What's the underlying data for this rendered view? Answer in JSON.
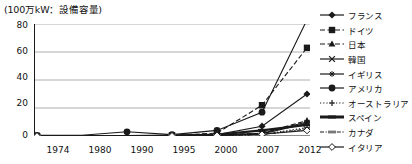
{
  "chart_data": {
    "type": "line",
    "title": "(100万kW：設備容量)",
    "xlabel": "",
    "ylabel": "100万kW：設備容量",
    "categories": [
      "1974",
      "1980",
      "1990",
      "1995",
      "2000",
      "2007",
      "2012"
    ],
    "ylim": [
      0,
      80
    ],
    "yticks": [
      0,
      20,
      40,
      60,
      80
    ],
    "grid": true,
    "legend_position": "right",
    "series": [
      {
        "name": "フランス",
        "marker": "diamond-filled",
        "line": "solid",
        "values": [
          0,
          0,
          0,
          0.5,
          1,
          7,
          30
        ]
      },
      {
        "name": "ドイツ",
        "marker": "square-filled",
        "line": "dashed",
        "values": [
          0,
          0,
          0,
          0.5,
          2,
          22,
          63
        ]
      },
      {
        "name": "日本",
        "marker": "triangle-filled",
        "line": "dashed",
        "values": [
          0,
          0,
          0,
          0.3,
          0.8,
          2,
          11
        ]
      },
      {
        "name": "韓国",
        "marker": "x-cross",
        "line": "solid",
        "values": [
          0,
          0,
          0,
          0.2,
          0.5,
          1.5,
          9
        ]
      },
      {
        "name": "イギリス",
        "marker": "asterisk",
        "line": "solid",
        "values": [
          0,
          0,
          0,
          0.3,
          0.7,
          2,
          10
        ]
      },
      {
        "name": "アメリカ",
        "marker": "circle-filled",
        "line": "solid",
        "values": [
          0.5,
          0.5,
          3,
          1,
          4,
          17,
          83
        ]
      },
      {
        "name": "オーストラリア",
        "marker": "plus-cross",
        "line": "dotted",
        "values": [
          0,
          0,
          0,
          0.1,
          0.3,
          1,
          6
        ]
      },
      {
        "name": "スペイン",
        "marker": "bar",
        "line": "solid-thick",
        "values": [
          0,
          0,
          0,
          0.3,
          1,
          4,
          8
        ]
      },
      {
        "name": "カナダ",
        "marker": "bar-dashed",
        "line": "dash-dot",
        "values": [
          0,
          0,
          0,
          0.1,
          0.3,
          1,
          5
        ]
      },
      {
        "name": "イタリア",
        "marker": "diamond-open",
        "line": "solid",
        "values": [
          0,
          0,
          0,
          0.1,
          0.4,
          1.2,
          4
        ]
      }
    ]
  },
  "axis": {
    "y_tick_labels": [
      "80",
      "60",
      "40",
      "20",
      "0"
    ],
    "x_tick_labels": [
      "1974",
      "1980",
      "1990",
      "1995",
      "2000",
      "2007",
      "2012"
    ]
  },
  "legend": {
    "items": [
      {
        "label": "フランス"
      },
      {
        "label": "ドイツ"
      },
      {
        "label": "日本"
      },
      {
        "label": "韓国"
      },
      {
        "label": "イギリス"
      },
      {
        "label": "アメリカ"
      },
      {
        "label": "オーストラリア"
      },
      {
        "label": "スペイン"
      },
      {
        "label": "カナダ"
      },
      {
        "label": "イタリア"
      }
    ]
  },
  "colors": {
    "ink": "#1a1a1a",
    "grid": "#9a9a9a",
    "background": "#ffffff"
  }
}
